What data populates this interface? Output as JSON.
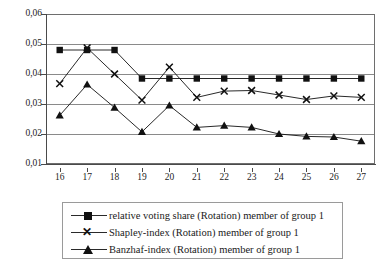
{
  "chart_data": {
    "type": "line",
    "title": "",
    "xlabel": "",
    "ylabel": "",
    "grid": true,
    "legend_position": "bottom",
    "x": [
      16,
      17,
      18,
      19,
      20,
      21,
      22,
      23,
      24,
      25,
      26,
      27
    ],
    "categories": [
      "16",
      "17",
      "18",
      "19",
      "20",
      "21",
      "22",
      "23",
      "24",
      "25",
      "26",
      "27"
    ],
    "xtick_labels": [
      "16",
      "17",
      "18",
      "19",
      "20",
      "21",
      "22",
      "23",
      "24",
      "25",
      "26",
      "27"
    ],
    "ytick_labels": [
      "0,06",
      "0,05",
      "0,04",
      "0,03",
      "0,02",
      "0,01"
    ],
    "ytick_values": [
      0.06,
      0.05,
      0.04,
      0.03,
      0.02,
      0.01
    ],
    "ylim": [
      0.01,
      0.06
    ],
    "decimal_separator": ",",
    "series": [
      {
        "name": "relative voting share (Rotation) member of group 1",
        "marker": "square",
        "color": "#111111",
        "values": [
          0.048,
          0.048,
          0.048,
          0.0385,
          0.0385,
          0.0385,
          0.0385,
          0.0385,
          0.0385,
          0.0385,
          0.0385,
          0.0385
        ]
      },
      {
        "name": "Shapley-index (Rotation) member of group  1",
        "marker": "x",
        "color": "#111111",
        "values": [
          0.0368,
          0.0487,
          0.04,
          0.0313,
          0.0423,
          0.0322,
          0.0343,
          0.0345,
          0.033,
          0.0315,
          0.0327,
          0.0322
        ]
      },
      {
        "name": "Banzhaf-index (Rotation) member of group 1",
        "marker": "triangle",
        "color": "#111111",
        "values": [
          0.0262,
          0.0365,
          0.0288,
          0.0207,
          0.0295,
          0.0222,
          0.0228,
          0.0222,
          0.02,
          0.0192,
          0.019,
          0.0176
        ]
      }
    ]
  },
  "legend": {
    "items": [
      {
        "label": "relative voting share (Rotation) member of group 1",
        "marker": "square"
      },
      {
        "label": "Shapley-index (Rotation) member of group  1",
        "marker": "x"
      },
      {
        "label": "Banzhaf-index (Rotation) member of group 1",
        "marker": "triangle"
      }
    ]
  }
}
